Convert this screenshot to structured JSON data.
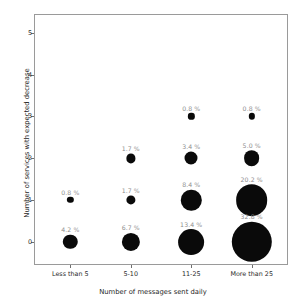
{
  "chart_data": {
    "type": "scatter",
    "title": "",
    "xlabel": "Number of messages sent daily",
    "ylabel": "Number of services with expected decrease",
    "categories": [
      "Less than 5",
      "5-10",
      "11-25",
      "More than 25"
    ],
    "ytick_labels": [
      "0",
      "1",
      "2",
      "3",
      "4",
      "5"
    ],
    "ylim": [
      -0.55,
      5.45
    ],
    "xlim": [
      -0.6,
      3.6
    ],
    "grid": false,
    "legend": null,
    "marker_color": "#0a0a0a",
    "label_color": "#8e8e8e",
    "axis_color": "#9a9a9a",
    "size_encoding": "bubble area proportional to percentage",
    "points": [
      {
        "x_category": "Less than 5",
        "x": 0,
        "y": 1,
        "value": 0.8,
        "label": "0.8 %"
      },
      {
        "x_category": "Less than 5",
        "x": 0,
        "y": 0,
        "value": 4.2,
        "label": "4.2 %"
      },
      {
        "x_category": "5-10",
        "x": 1,
        "y": 2,
        "value": 1.7,
        "label": "1.7 %"
      },
      {
        "x_category": "5-10",
        "x": 1,
        "y": 1,
        "value": 1.7,
        "label": "1.7 %"
      },
      {
        "x_category": "5-10",
        "x": 1,
        "y": 0,
        "value": 6.7,
        "label": "6.7 %"
      },
      {
        "x_category": "11-25",
        "x": 2,
        "y": 3,
        "value": 0.8,
        "label": "0.8 %"
      },
      {
        "x_category": "11-25",
        "x": 2,
        "y": 2,
        "value": 3.4,
        "label": "3.4 %"
      },
      {
        "x_category": "11-25",
        "x": 2,
        "y": 1,
        "value": 8.4,
        "label": "8.4 %"
      },
      {
        "x_category": "11-25",
        "x": 2,
        "y": 0,
        "value": 13.4,
        "label": "13.4 %"
      },
      {
        "x_category": "More than 25",
        "x": 3,
        "y": 3,
        "value": 0.8,
        "label": "0.8 %"
      },
      {
        "x_category": "More than 25",
        "x": 3,
        "y": 2,
        "value": 5.0,
        "label": "5.0 %"
      },
      {
        "x_category": "More than 25",
        "x": 3,
        "y": 1,
        "value": 20.2,
        "label": "20.2 %"
      },
      {
        "x_category": "More than 25",
        "x": 3,
        "y": 0,
        "value": 32.8,
        "label": "32.8 %"
      }
    ]
  }
}
